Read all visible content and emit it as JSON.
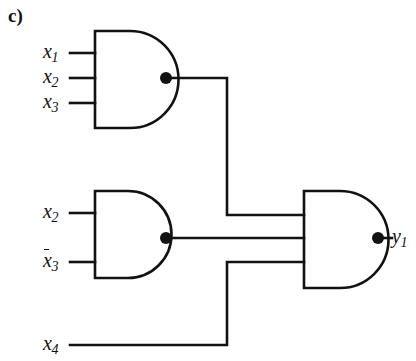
{
  "figure": {
    "panel_label": "c)",
    "type": "logic-circuit-diagram",
    "stroke_color": "#121212",
    "background_color": "#ffffff"
  },
  "labels": {
    "gate1_input1": "x",
    "gate1_input1_sub": "1",
    "gate1_input2": "x",
    "gate1_input2_sub": "2",
    "gate1_input3": "x",
    "gate1_input3_sub": "3",
    "gate2_input1": "x",
    "gate2_input1_sub": "2",
    "gate2_input2": "x",
    "gate2_input2_sub": "3",
    "input_x4": "x",
    "input_x4_sub": "4",
    "output": "y",
    "output_sub": "1"
  },
  "circuit": {
    "gates": [
      {
        "id": "gate1",
        "name": "and-gate-top",
        "type": "AND",
        "inputs": [
          "x1",
          "x2",
          "x3"
        ],
        "inverted_inputs": [],
        "output_node": "dot1",
        "body": {
          "x": 94,
          "y": 30,
          "width": 71,
          "height": 97
        }
      },
      {
        "id": "gate2",
        "name": "and-gate-middle",
        "type": "AND",
        "inputs": [
          "x2",
          "not_x3"
        ],
        "inverted_inputs": [
          "x3"
        ],
        "output_node": "dot2",
        "body": {
          "x": 94,
          "y": 190,
          "width": 71,
          "height": 87
        }
      },
      {
        "id": "gate3",
        "name": "and-gate-output",
        "type": "AND",
        "inputs": [
          "gate1_out",
          "gate2_out",
          "x4"
        ],
        "inverted_inputs": [],
        "output_node": "dot3",
        "body": {
          "x": 303,
          "y": 190,
          "width": 75,
          "height": 97
        }
      }
    ],
    "junction_dots": [
      {
        "id": "dot1",
        "x": 166,
        "y": 78,
        "r": 6
      },
      {
        "id": "dot2",
        "x": 166,
        "y": 238,
        "r": 6
      },
      {
        "id": "dot3",
        "x": 378,
        "y": 238,
        "r": 6
      }
    ],
    "expression": "y1 = (x1 x2 x3)(x2 x3')(x4)"
  }
}
